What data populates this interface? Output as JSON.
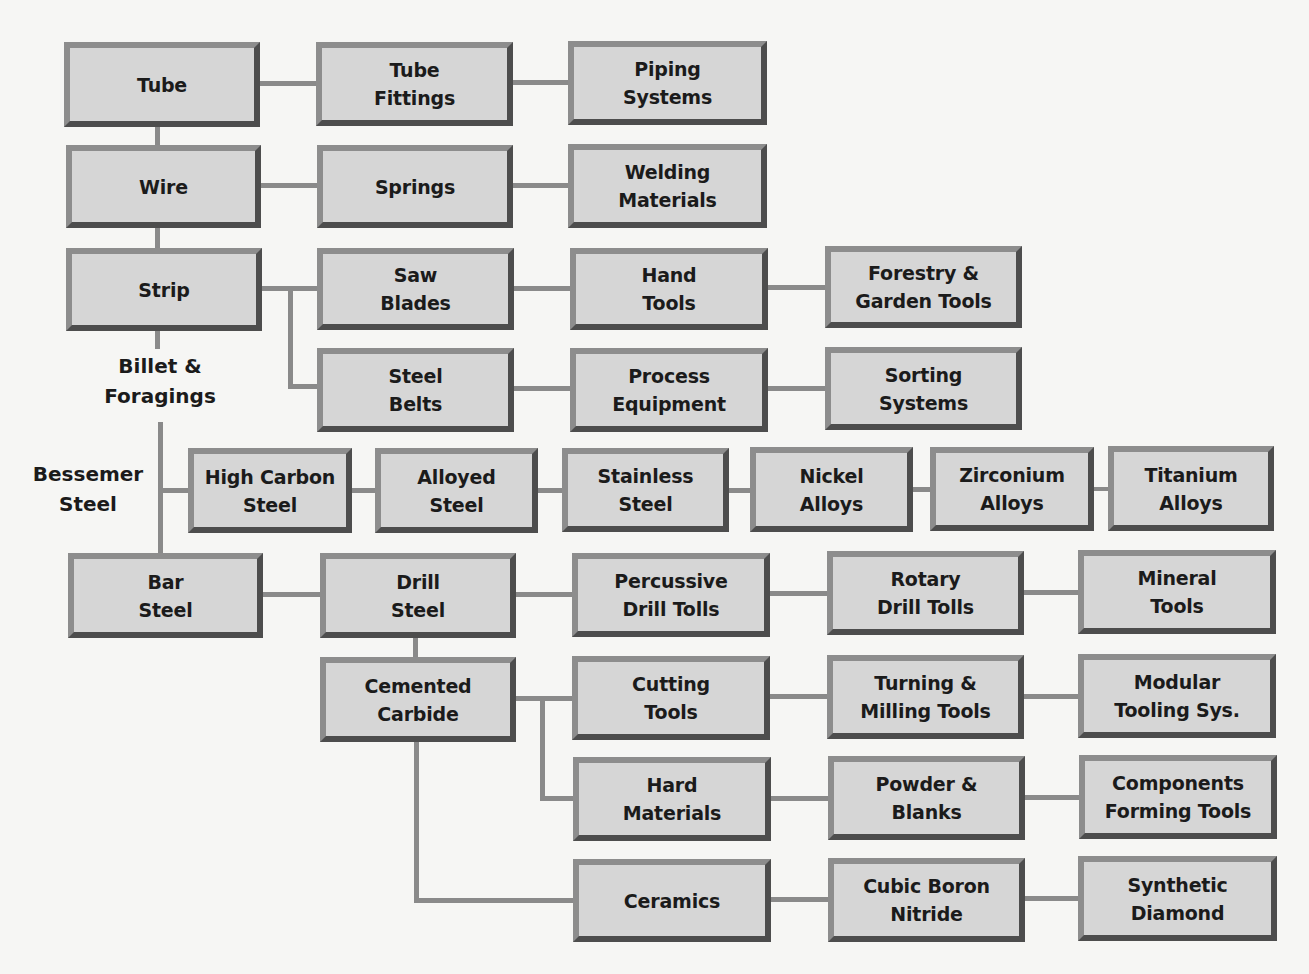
{
  "diagram": {
    "colors": {
      "box_fill": "#d6d6d6",
      "frame_light": "#8d8d8d",
      "frame_dark": "#4d4d4d",
      "connector": "#8a8a8a",
      "text": "#1b1b1b",
      "background": "#f6f6f4"
    },
    "labels": [
      {
        "id": "billet",
        "text": "Billet &\nForagings",
        "x": 90,
        "y": 351,
        "w": 140
      },
      {
        "id": "bessemer",
        "text": "Bessemer\nSteel",
        "x": 18,
        "y": 459,
        "w": 140
      }
    ],
    "nodes": [
      {
        "id": "tube",
        "text": "Tube",
        "x": 64,
        "y": 42,
        "w": 196,
        "h": 85
      },
      {
        "id": "tube-fittings",
        "text": "Tube\nFittings",
        "x": 316,
        "y": 42,
        "w": 197,
        "h": 84
      },
      {
        "id": "piping-systems",
        "text": "Piping\nSystems",
        "x": 568,
        "y": 41,
        "w": 199,
        "h": 84
      },
      {
        "id": "wire",
        "text": "Wire",
        "x": 66,
        "y": 145,
        "w": 195,
        "h": 83
      },
      {
        "id": "springs",
        "text": "Springs",
        "x": 317,
        "y": 145,
        "w": 196,
        "h": 83
      },
      {
        "id": "welding-materials",
        "text": "Welding\nMaterials",
        "x": 568,
        "y": 144,
        "w": 199,
        "h": 84
      },
      {
        "id": "strip",
        "text": "Strip",
        "x": 66,
        "y": 248,
        "w": 196,
        "h": 83
      },
      {
        "id": "saw-blades",
        "text": "Saw\nBlades",
        "x": 317,
        "y": 248,
        "w": 197,
        "h": 82
      },
      {
        "id": "hand-tools",
        "text": "Hand\nTools",
        "x": 570,
        "y": 248,
        "w": 198,
        "h": 82
      },
      {
        "id": "forestry-garden-tools",
        "text": "Forestry &\nGarden Tools",
        "x": 825,
        "y": 246,
        "w": 197,
        "h": 82
      },
      {
        "id": "steel-belts",
        "text": "Steel\nBelts",
        "x": 317,
        "y": 348,
        "w": 197,
        "h": 84
      },
      {
        "id": "process-equipment",
        "text": "Process\nEquipment",
        "x": 570,
        "y": 348,
        "w": 198,
        "h": 84
      },
      {
        "id": "sorting-systems",
        "text": "Sorting\nSystems",
        "x": 825,
        "y": 347,
        "w": 197,
        "h": 83
      },
      {
        "id": "high-carbon-steel",
        "text": "High Carbon\nSteel",
        "x": 188,
        "y": 448,
        "w": 164,
        "h": 85
      },
      {
        "id": "alloyed-steel",
        "text": "Alloyed\nSteel",
        "x": 375,
        "y": 448,
        "w": 163,
        "h": 85
      },
      {
        "id": "stainless-steel",
        "text": "Stainless\nSteel",
        "x": 562,
        "y": 448,
        "w": 167,
        "h": 84
      },
      {
        "id": "nickel-alloys",
        "text": "Nickel\nAlloys",
        "x": 750,
        "y": 447,
        "w": 163,
        "h": 85
      },
      {
        "id": "zirconium-alloys",
        "text": "Zirconium\nAlloys",
        "x": 930,
        "y": 447,
        "w": 164,
        "h": 84
      },
      {
        "id": "titanium-alloys",
        "text": "Titanium\nAlloys",
        "x": 1108,
        "y": 446,
        "w": 166,
        "h": 85
      },
      {
        "id": "bar-steel",
        "text": "Bar\nSteel",
        "x": 68,
        "y": 553,
        "w": 195,
        "h": 85
      },
      {
        "id": "drill-steel",
        "text": "Drill\nSteel",
        "x": 320,
        "y": 553,
        "w": 196,
        "h": 85
      },
      {
        "id": "percussive-drill-tolls",
        "text": "Percussive\nDrill Tolls",
        "x": 572,
        "y": 553,
        "w": 198,
        "h": 84
      },
      {
        "id": "rotary-drill-tolls",
        "text": "Rotary\nDrill Tolls",
        "x": 827,
        "y": 551,
        "w": 197,
        "h": 84
      },
      {
        "id": "mineral-tools",
        "text": "Mineral\nTools",
        "x": 1078,
        "y": 550,
        "w": 198,
        "h": 84
      },
      {
        "id": "cemented-carbide",
        "text": "Cemented\nCarbide",
        "x": 320,
        "y": 657,
        "w": 196,
        "h": 85
      },
      {
        "id": "cutting-tools",
        "text": "Cutting\nTools",
        "x": 572,
        "y": 656,
        "w": 198,
        "h": 84
      },
      {
        "id": "turning-milling-tools",
        "text": "Turning &\nMilling Tools",
        "x": 827,
        "y": 655,
        "w": 197,
        "h": 84
      },
      {
        "id": "modular-tooling-sys",
        "text": "Modular\nTooling Sys.",
        "x": 1078,
        "y": 654,
        "w": 198,
        "h": 84
      },
      {
        "id": "hard-materials",
        "text": "Hard\nMaterials",
        "x": 573,
        "y": 757,
        "w": 198,
        "h": 84
      },
      {
        "id": "powder-blanks",
        "text": "Powder &\nBlanks",
        "x": 828,
        "y": 756,
        "w": 197,
        "h": 84
      },
      {
        "id": "components-forming-tools",
        "text": "Components\nForming Tools",
        "x": 1079,
        "y": 755,
        "w": 198,
        "h": 84
      },
      {
        "id": "ceramics",
        "text": "Ceramics",
        "x": 573,
        "y": 859,
        "w": 198,
        "h": 83
      },
      {
        "id": "cubic-boron-nitride",
        "text": "Cubic Boron\nNitride",
        "x": 828,
        "y": 858,
        "w": 197,
        "h": 84
      },
      {
        "id": "synthetic-diamond",
        "text": "Synthetic\nDiamond",
        "x": 1078,
        "y": 856,
        "w": 199,
        "h": 85
      }
    ],
    "connectors": [
      {
        "x": 260,
        "y": 81,
        "w": 56,
        "h": 5
      },
      {
        "x": 513,
        "y": 80,
        "w": 55,
        "h": 5
      },
      {
        "x": 155,
        "y": 127,
        "w": 5,
        "h": 18
      },
      {
        "x": 261,
        "y": 183,
        "w": 56,
        "h": 5
      },
      {
        "x": 513,
        "y": 183,
        "w": 55,
        "h": 5
      },
      {
        "x": 155,
        "y": 228,
        "w": 5,
        "h": 20
      },
      {
        "x": 262,
        "y": 286,
        "w": 55,
        "h": 5
      },
      {
        "x": 288,
        "y": 286,
        "w": 5,
        "h": 103
      },
      {
        "x": 288,
        "y": 384,
        "w": 29,
        "h": 5
      },
      {
        "x": 514,
        "y": 286,
        "w": 56,
        "h": 5
      },
      {
        "x": 768,
        "y": 285,
        "w": 57,
        "h": 5
      },
      {
        "x": 514,
        "y": 386,
        "w": 56,
        "h": 5
      },
      {
        "x": 768,
        "y": 386,
        "w": 57,
        "h": 5
      },
      {
        "x": 155,
        "y": 331,
        "w": 5,
        "h": 18
      },
      {
        "x": 158,
        "y": 422,
        "w": 5,
        "h": 131
      },
      {
        "x": 158,
        "y": 488,
        "w": 30,
        "h": 5
      },
      {
        "x": 352,
        "y": 488,
        "w": 23,
        "h": 5
      },
      {
        "x": 538,
        "y": 488,
        "w": 24,
        "h": 5
      },
      {
        "x": 729,
        "y": 488,
        "w": 21,
        "h": 5
      },
      {
        "x": 913,
        "y": 487,
        "w": 17,
        "h": 5
      },
      {
        "x": 1094,
        "y": 487,
        "w": 14,
        "h": 4
      },
      {
        "x": 263,
        "y": 592,
        "w": 57,
        "h": 5
      },
      {
        "x": 516,
        "y": 592,
        "w": 56,
        "h": 5
      },
      {
        "x": 770,
        "y": 591,
        "w": 57,
        "h": 5
      },
      {
        "x": 1024,
        "y": 590,
        "w": 54,
        "h": 5
      },
      {
        "x": 413,
        "y": 638,
        "w": 5,
        "h": 19
      },
      {
        "x": 516,
        "y": 696,
        "w": 56,
        "h": 5
      },
      {
        "x": 540,
        "y": 696,
        "w": 5,
        "h": 103
      },
      {
        "x": 540,
        "y": 796,
        "w": 33,
        "h": 5
      },
      {
        "x": 770,
        "y": 694,
        "w": 57,
        "h": 5
      },
      {
        "x": 1024,
        "y": 694,
        "w": 54,
        "h": 5
      },
      {
        "x": 771,
        "y": 796,
        "w": 57,
        "h": 5
      },
      {
        "x": 1025,
        "y": 795,
        "w": 54,
        "h": 5
      },
      {
        "x": 414,
        "y": 742,
        "w": 5,
        "h": 161
      },
      {
        "x": 414,
        "y": 898,
        "w": 159,
        "h": 5
      },
      {
        "x": 771,
        "y": 897,
        "w": 57,
        "h": 5
      },
      {
        "x": 1025,
        "y": 896,
        "w": 53,
        "h": 5
      }
    ]
  }
}
